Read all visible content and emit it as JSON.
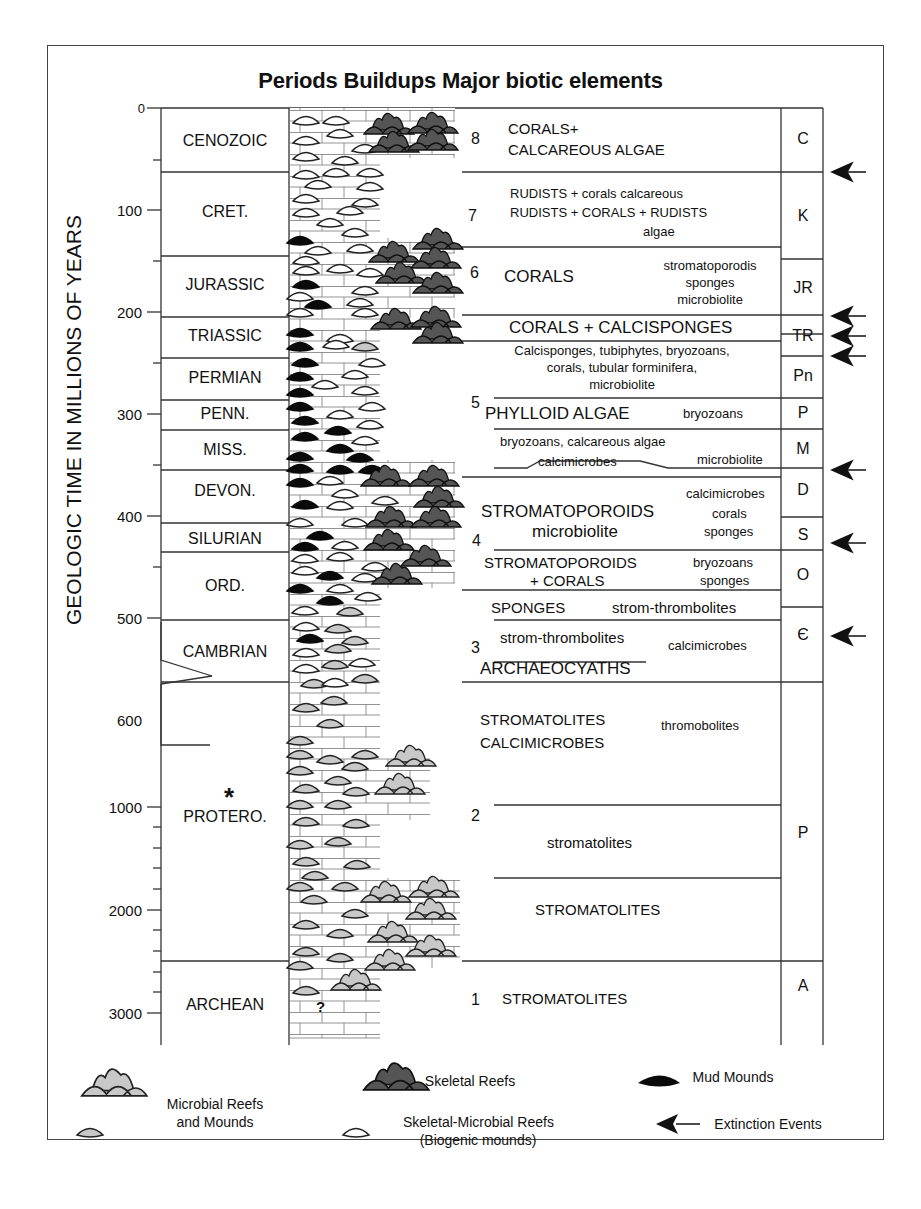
{
  "title": "Periods Buildups Major biotic elements",
  "y_axis": {
    "label": "GEOLOGIC TIME IN MILLIONS OF YEARS",
    "ticks": [
      "0",
      "100",
      "200",
      "300",
      "400",
      "500",
      "600",
      "1000",
      "2000",
      "3000"
    ],
    "break_marker": "*"
  },
  "periods": [
    {
      "name": "CENOZOIC",
      "abbr": "C"
    },
    {
      "name": "CRET.",
      "abbr": "K"
    },
    {
      "name": "JURASSIC",
      "abbr": "JR"
    },
    {
      "name": "TRIASSIC",
      "abbr": "TR"
    },
    {
      "name": "PERMIAN",
      "abbr": "Pn"
    },
    {
      "name": "PENN.",
      "abbr": "P"
    },
    {
      "name": "MISS.",
      "abbr": "M"
    },
    {
      "name": "DEVON.",
      "abbr": "D"
    },
    {
      "name": "SILURIAN",
      "abbr": "S"
    },
    {
      "name": "ORD.",
      "abbr": "O"
    },
    {
      "name": "CAMBRIAN",
      "abbr": "Є"
    },
    {
      "name": "PROTERO.",
      "abbr": "P"
    },
    {
      "name": "ARCHEAN",
      "abbr": "A"
    }
  ],
  "unknown_marker": "?",
  "biotic": {
    "b8_num": "8",
    "b8_l1": "CORALS+",
    "b8_l2": "CALCAREOUS ALGAE",
    "b7_num": "7",
    "b7_l1": "RUDISTS + corals calcareous",
    "b7_l2": "RUDISTS + CORALS + RUDISTS",
    "b7_l3": "algae",
    "b6_num": "6",
    "b6_main": "CORALS",
    "b6_s1": "stromatoporodis",
    "b6_s2": "sponges",
    "b6_s3": "microbiolite",
    "tr_main": "CORALS + CALCISPONGES",
    "pn_l1": "Calcisponges, tubiphytes, bryozoans,",
    "pn_l2": "corals, tubular forminifera,",
    "pn_l3": "microbiolite",
    "b5_num": "5",
    "b5_main": "PHYLLOID ALGAE",
    "b5_side": "bryozoans",
    "m_l1": "bryozoans, calcareous algae",
    "m_l2": "calcimicrobes",
    "m_side": "microbiolite",
    "b4_num": "4",
    "d_main": "STROMATOPOROIDS",
    "d_sub": "microbiolite",
    "d_s1": "calcimicrobes",
    "d_s2": "corals",
    "d_s3": "sponges",
    "o_l1": "STROMATOPOROIDS",
    "o_l2": "+ CORALS",
    "o_s1": "bryozoans",
    "o_s2": "sponges",
    "o2_main": "SPONGES",
    "o2_side": "strom-thrombolites",
    "b3_num": "3",
    "c_l1": "strom-thrombolites",
    "c_side": "calcimicrobes",
    "c_l2": "ARCHAEOCYATHS",
    "p_l1": "STROMATOLITES",
    "p_l2": "CALCIMICROBES",
    "p_side": "thromobolites",
    "b2_num": "2",
    "p_mid": "stromatolites",
    "p_low": "STROMATOLITES",
    "b1_num": "1",
    "a_main": "STROMATOLITES"
  },
  "legend": {
    "microbial": "Microbial Reefs",
    "microbial2": "and Mounds",
    "skeletal": "Skeletal Reefs",
    "skelmicro": "Skeletal-Microbial Reefs",
    "skelmicro2": "(Biogenic mounds)",
    "mud": "Mud Mounds",
    "extinction": "Extinction Events"
  },
  "colors": {
    "skeletal_reef": "#555555",
    "microbial_reef": "#c8c8c8",
    "mud_mound": "#0a0a0a",
    "line": "#333333"
  }
}
